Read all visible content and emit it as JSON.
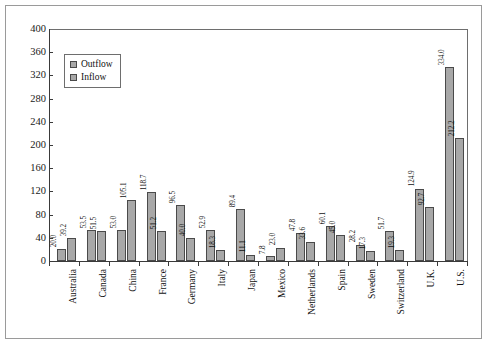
{
  "chart_data": {
    "type": "bar",
    "title": "",
    "xlabel": "",
    "ylabel": "",
    "ylim": [
      0,
      400
    ],
    "yticks": [
      0,
      40,
      80,
      120,
      160,
      200,
      240,
      280,
      320,
      360,
      400
    ],
    "grid": false,
    "legend_position": "upper-left-inside",
    "categories": [
      "Australia",
      "Canada",
      "China",
      "France",
      "Germany",
      "Italy",
      "Japan",
      "Mexico",
      "Netherlands",
      "Spain",
      "Sweden",
      "Switzerland",
      "U.K.",
      "U.S."
    ],
    "series": [
      {
        "name": "Outflow",
        "color": "#a8a8a8",
        "values": [
          20.0,
          53.5,
          53.0,
          118.7,
          96.5,
          52.9,
          89.4,
          7.8,
          47.8,
          60.1,
          28.2,
          51.7,
          124.9,
          334.0
        ],
        "labels": [
          "20.0",
          "53.5",
          "53.0",
          "118.7",
          "96.5",
          "52.9",
          "89.4",
          "7.8",
          "47.8",
          "60.1",
          "28.2",
          "51.7",
          "124.9",
          "334.0"
        ]
      },
      {
        "name": "Inflow",
        "color": "#a8a8a8",
        "values": [
          39.2,
          51.5,
          105.1,
          51.2,
          40.0,
          18.3,
          11.1,
          23.0,
          33.6,
          45.0,
          17.3,
          19.3,
          92.7,
          212.2
        ],
        "labels": [
          "39.2",
          "51.5",
          "105.1",
          "51.2",
          "40.0",
          "18.3",
          "11.1",
          "23.0",
          "33.6",
          "45.0",
          "17.3",
          "19.3",
          "92.7",
          "212.2"
        ]
      }
    ]
  },
  "legend": {
    "items": [
      {
        "label": "Outflow"
      },
      {
        "label": "Inflow"
      }
    ]
  },
  "colors": {
    "bar_fill": "#a8a8a8",
    "bar_stroke": "#4a4a4a",
    "axis": "#3a3a3a",
    "frame": "#9a9a9a",
    "background": "#ffffff"
  }
}
